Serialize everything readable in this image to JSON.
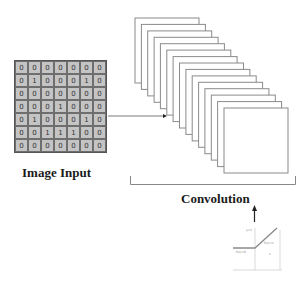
{
  "input": {
    "label": "Image Input",
    "grid": [
      [
        "0",
        "0",
        "0",
        "0",
        "0",
        "0",
        "0"
      ],
      [
        "0",
        "1",
        "0",
        "0",
        "0",
        "1",
        "0"
      ],
      [
        "0",
        "0",
        "0",
        "0",
        "0",
        "0",
        "0"
      ],
      [
        "0",
        "0",
        "0",
        "1",
        "0",
        "0",
        "0"
      ],
      [
        "0",
        "1",
        "0",
        "0",
        "0",
        "1",
        "0"
      ],
      [
        "0",
        "0",
        "1",
        "1",
        "1",
        "0",
        "0"
      ],
      [
        "0",
        "0",
        "0",
        "0",
        "0",
        "0",
        "0"
      ]
    ]
  },
  "convolution": {
    "label": "Convolution",
    "feature_map_count": 15
  },
  "activation": {
    "name": "ReLU",
    "labels": {
      "y_axis": "y=x",
      "left_segment": "f(x)=0",
      "right_segment": "f(x)=x",
      "x_axis": "x"
    }
  },
  "colors": {
    "grid_fill": "#c4c4c4",
    "grid_line": "#6e6e6e",
    "stroke": "#888888",
    "text": "#1a1a1a"
  }
}
